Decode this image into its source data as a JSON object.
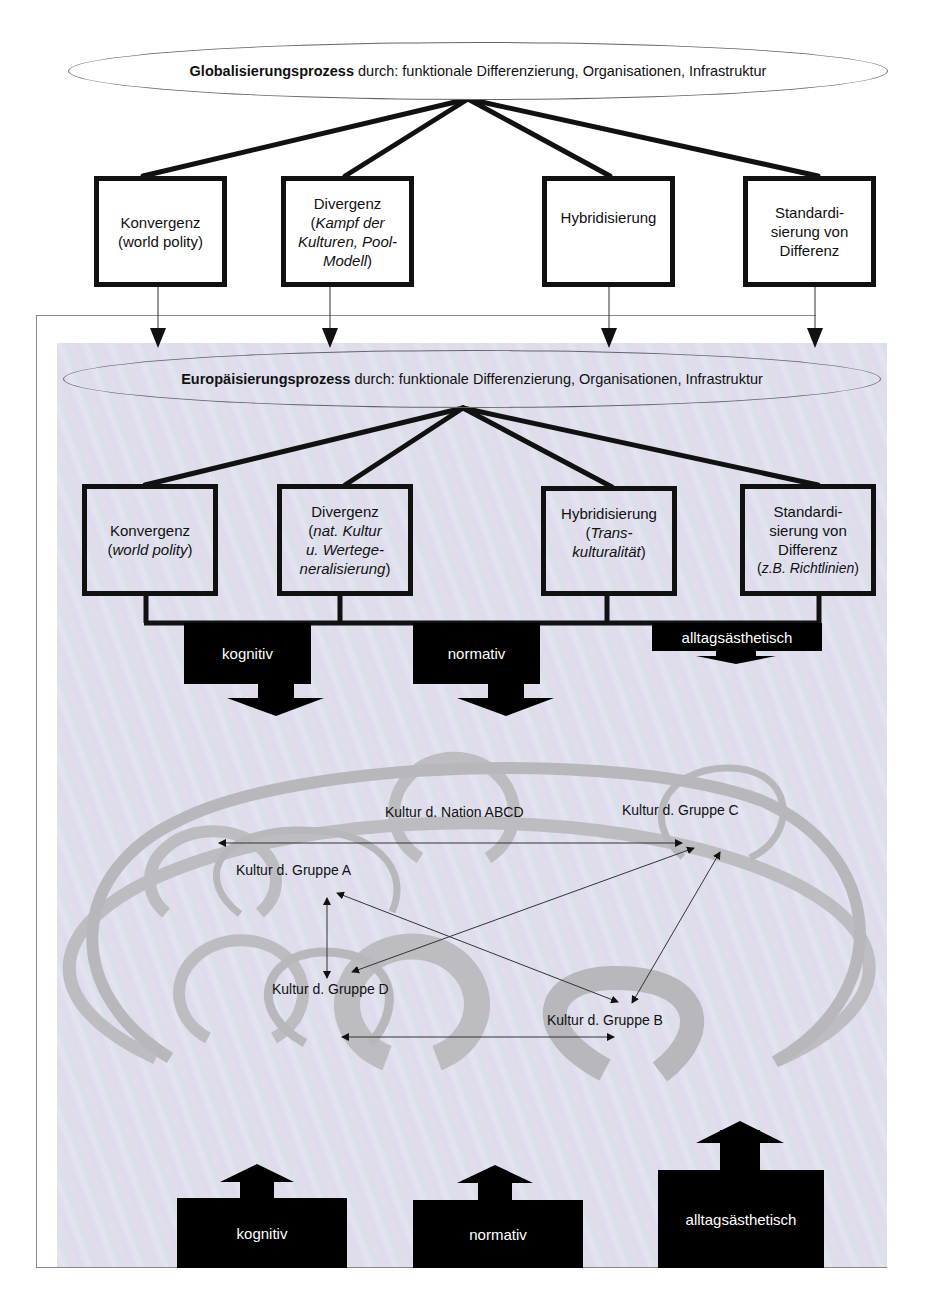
{
  "global_process": {
    "bold": "Globalisierungsprozess",
    "rest": " durch: funktionale Differenzierung, Organisationen, Infrastruktur"
  },
  "global_boxes": [
    {
      "title": "Konvergenz",
      "sub": "(world polity)",
      "sub_italic": false
    },
    {
      "title": "Divergenz",
      "sub_open": "(",
      "sub": "Kampf der Kulturen, Pool-Modell",
      "sub_close": ")",
      "sub_italic": true
    },
    {
      "title": "Hybridisierung"
    },
    {
      "line1": "Standardi-",
      "line2": "sierung von",
      "line3": "Differenz"
    }
  ],
  "euro_process": {
    "bold": "Europäisierungsprozess",
    "rest": " durch: funktionale Differenzierung, Organisationen, Infrastruktur"
  },
  "euro_boxes": [
    {
      "title": "Konvergenz",
      "sub": "world polity"
    },
    {
      "title": "Divergenz",
      "sub_l1": "nat. Kultur",
      "sub_l2": "u. Wertege-",
      "sub_l3": "neralisierung"
    },
    {
      "title": "Hybridisierung",
      "sub_l1": "Trans-",
      "sub_l2": "kulturalität"
    },
    {
      "line1": "Standardi-",
      "line2": "sierung von",
      "line3": "Differenz",
      "sub": "z.B. Richtlinien"
    }
  ],
  "down_arrows": [
    "kognitiv",
    "normativ",
    "alltagsästhetisch"
  ],
  "culture_circles": {
    "nation": "Kultur d. Nation ABCD",
    "group_a": "Kultur d. Gruppe A",
    "group_b": "Kultur d. Gruppe B",
    "group_c": "Kultur d. Gruppe C",
    "group_d": "Kultur d. Gruppe D"
  },
  "up_arrows": [
    "kognitiv",
    "normativ",
    "alltagsästhetisch"
  ],
  "colors": {
    "line": "#111111",
    "ring": "#b9b9bd",
    "background_tint": "#e0def0"
  }
}
